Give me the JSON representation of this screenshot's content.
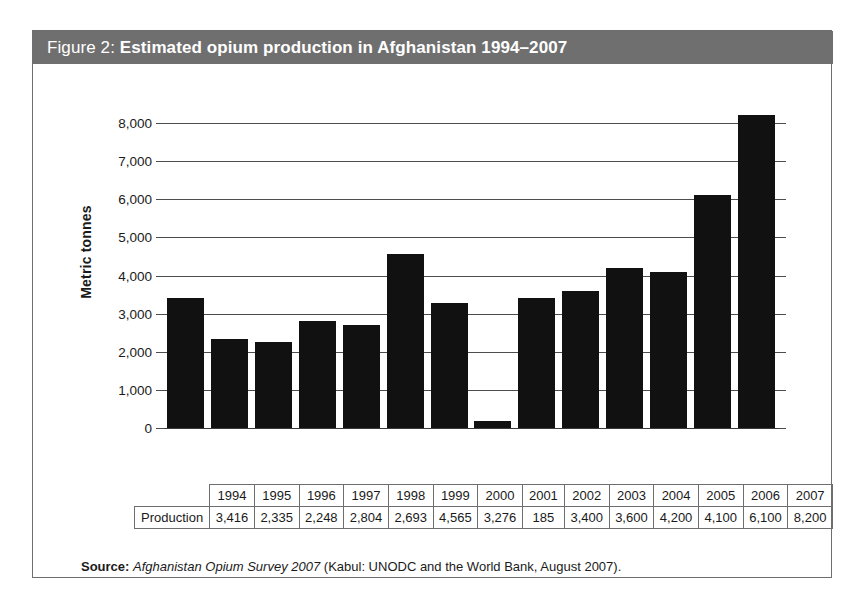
{
  "figure": {
    "label": "Figure 2: ",
    "title": "Estimated opium production in Afghanistan 1994–2007",
    "header_bg": "#706f6f",
    "header_text_color": "#ffffff"
  },
  "source": {
    "label": "Source: ",
    "italic_part": "Afghanistan Opium Survey 2007",
    "rest": " (Kabul: UNODC and the World Bank, August 2007)."
  },
  "table": {
    "row_header": "Production",
    "years": [
      "1994",
      "1995",
      "1996",
      "1997",
      "1998",
      "1999",
      "2000",
      "2001",
      "2002",
      "2003",
      "2004",
      "2005",
      "2006",
      "2007"
    ],
    "values": [
      "3,416",
      "2,335",
      "2,248",
      "2,804",
      "2,693",
      "4,565",
      "3,276",
      "185",
      "3,400",
      "3,600",
      "4,200",
      "4,100",
      "6,100",
      "8,200"
    ]
  },
  "chart_data": {
    "type": "bar",
    "title": "Estimated opium production in Afghanistan 1994–2007",
    "xlabel": "",
    "ylabel": "Metric tonnes",
    "categories": [
      "1994",
      "1995",
      "1996",
      "1997",
      "1998",
      "1999",
      "2000",
      "2001",
      "2002",
      "2003",
      "2004",
      "2005",
      "2006",
      "2007"
    ],
    "values": [
      3416,
      2335,
      2248,
      2804,
      2693,
      4565,
      3276,
      185,
      3400,
      3600,
      4200,
      4100,
      6100,
      8200
    ],
    "ylim": [
      0,
      8000
    ],
    "ytick_labels": [
      "8,000",
      "7,000",
      "6,000",
      "5,000",
      "4,000",
      "3,000",
      "2,000",
      "1,000",
      "0"
    ],
    "ytick_values": [
      8000,
      7000,
      6000,
      5000,
      4000,
      3000,
      2000,
      1000,
      0
    ],
    "grid": true,
    "legend": false,
    "bar_color": "#111111",
    "gridline_color": "#4d4d4d"
  }
}
